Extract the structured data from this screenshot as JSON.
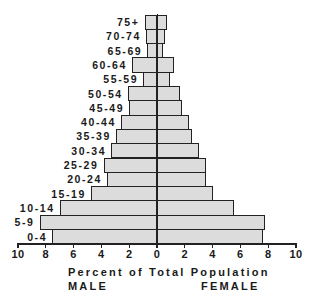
{
  "chart_data": {
    "type": "bar",
    "orientation": "horizontal-population-pyramid",
    "title": "",
    "xlabel": "Percent of Total Population",
    "side_labels": {
      "left": "MALE",
      "right": "FEMALE"
    },
    "xlim": [
      -10,
      10
    ],
    "x_ticks": [
      10,
      8,
      6,
      4,
      2,
      0,
      2,
      4,
      6,
      8,
      10
    ],
    "grid": false,
    "legend": null,
    "categories": [
      "75+",
      "70-74",
      "65-69",
      "60-64",
      "55-59",
      "50-54",
      "45-49",
      "40-44",
      "35-39",
      "30-34",
      "25-29",
      "20-24",
      "15-19",
      "10-14",
      "5-9",
      "0-4"
    ],
    "series": [
      {
        "name": "MALE",
        "side": "left",
        "values": [
          0.9,
          0.8,
          0.7,
          1.8,
          1.0,
          2.1,
          2.0,
          2.6,
          2.95,
          3.3,
          3.85,
          3.6,
          4.75,
          7.0,
          8.45,
          7.55
        ]
      },
      {
        "name": "FEMALE",
        "side": "right",
        "values": [
          0.7,
          0.6,
          0.45,
          1.2,
          0.9,
          1.65,
          1.8,
          2.3,
          2.55,
          3.05,
          3.5,
          3.5,
          4.0,
          5.55,
          7.8,
          7.6
        ]
      }
    ],
    "colors": {
      "bar_fill": "#dcdcdc",
      "bar_stipple": "#9a9a9a",
      "outline": "#222222"
    }
  },
  "axis": {
    "title": "Percent of Total Population",
    "male_label": "MALE",
    "female_label": "FEMALE",
    "tick_labels": [
      "10",
      "8",
      "6",
      "4",
      "2",
      "0",
      "2",
      "4",
      "6",
      "8",
      "10"
    ]
  }
}
